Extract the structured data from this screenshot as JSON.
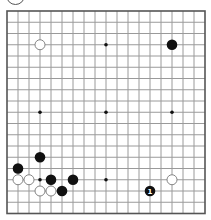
{
  "board": {
    "size": 19,
    "origin_x": 7,
    "origin_y": 11,
    "step_x": 11,
    "step_y": 11.25,
    "line_color": "#9a9a9a",
    "border_color": "#555555",
    "background": "#ffffff",
    "star_points": [
      [
        3,
        9
      ],
      [
        9,
        3
      ],
      [
        9,
        9
      ],
      [
        15,
        9
      ],
      [
        3,
        15
      ],
      [
        9,
        15
      ]
    ],
    "stones": [
      {
        "color": "white",
        "col": 3,
        "row": 3
      },
      {
        "color": "black",
        "col": 15,
        "row": 3
      },
      {
        "color": "black",
        "col": 3,
        "row": 13
      },
      {
        "color": "black",
        "col": 1,
        "row": 14
      },
      {
        "color": "white",
        "col": 1,
        "row": 15
      },
      {
        "color": "white",
        "col": 2,
        "row": 15
      },
      {
        "color": "black",
        "col": 4,
        "row": 15
      },
      {
        "color": "black",
        "col": 6,
        "row": 15
      },
      {
        "color": "white",
        "col": 3,
        "row": 16
      },
      {
        "color": "white",
        "col": 4,
        "row": 16
      },
      {
        "color": "black",
        "col": 5,
        "row": 16
      },
      {
        "color": "white",
        "col": 15,
        "row": 15
      },
      {
        "color": "black",
        "col": 13,
        "row": 16,
        "label": "1"
      }
    ]
  },
  "turn_indicator": {
    "color": "white"
  }
}
